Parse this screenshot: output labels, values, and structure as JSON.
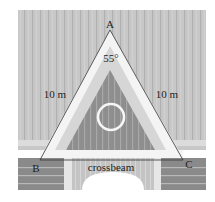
{
  "diagram": {
    "type": "labeled-triangle-roof",
    "vertices": {
      "apex": "A",
      "bottom_left": "B",
      "bottom_right": "C"
    },
    "angle_label": "55°",
    "left_side_label": "10 m",
    "right_side_label": "10 m",
    "base_label": "crossbeam"
  },
  "colors": {
    "background": "#ffffff",
    "roof_panel": "#c8c8c8",
    "roof_stripe": "#b2b2b2",
    "roof_stripe_light": "#dadada",
    "frame_white": "#f4f4f4",
    "frame_inner_band": "#d6d6d6",
    "inner_triangle": "#8e8e8e",
    "inner_stripe": "#a6a6a6",
    "brick_block": "#8a8a8a",
    "brick_line": "#b8b8b8",
    "arch_fill": "#c6c6c6",
    "outline": "#333333",
    "text": "#222222"
  }
}
